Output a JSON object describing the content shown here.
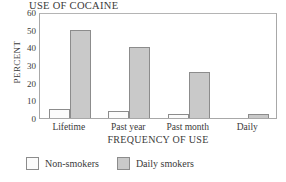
{
  "chart_data": {
    "type": "bar",
    "title": "USE OF COCAINE",
    "xlabel": "FREQUENCY OF USE",
    "ylabel": "PERCENT",
    "categories": [
      "Lifetime",
      "Past year",
      "Past month",
      "Daily"
    ],
    "series": [
      {
        "name": "Non-smokers",
        "values": [
          5,
          4,
          2.5,
          0
        ],
        "color": "#fbfbfb"
      },
      {
        "name": "Daily smokers",
        "values": [
          50,
          40,
          26,
          2
        ],
        "color": "#c9c9c9"
      }
    ],
    "ylim": [
      0,
      60
    ],
    "yticks": [
      0,
      10,
      20,
      30,
      40,
      50,
      60
    ],
    "ytick_labels": [
      "0",
      "10",
      "20",
      "30",
      "40",
      "50",
      "60"
    ],
    "grid": false,
    "legend_position": "bottom-left"
  },
  "legend": {
    "entries": [
      {
        "label": "Non-smokers"
      },
      {
        "label": "Daily smokers"
      }
    ]
  }
}
